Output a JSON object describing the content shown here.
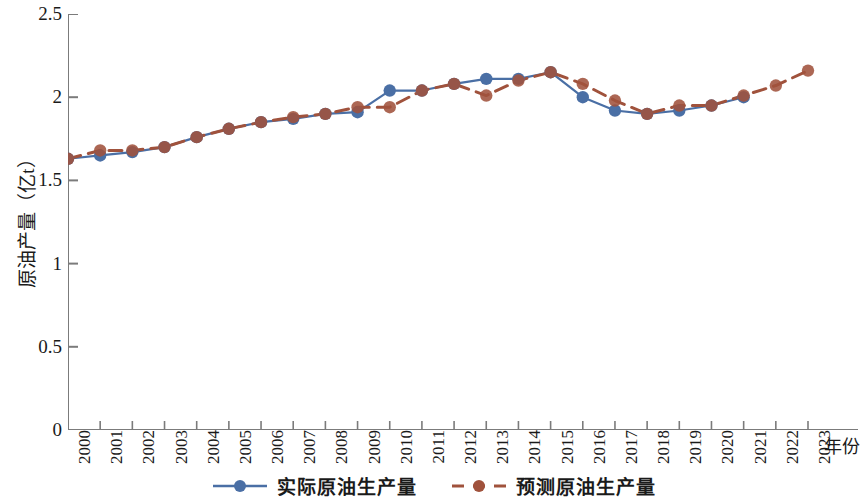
{
  "chart_data": {
    "type": "line",
    "title": "",
    "xlabel": "年份",
    "ylabel": "原油产量（亿t）",
    "categories": [
      "2000",
      "2001",
      "2002",
      "2003",
      "2004",
      "2005",
      "2006",
      "2007",
      "2008",
      "2009",
      "2010",
      "2011",
      "2012",
      "2013",
      "2014",
      "2015",
      "2016",
      "2017",
      "2018",
      "2019",
      "2020",
      "2021",
      "2022",
      "2023"
    ],
    "xlim": [
      2000,
      2023
    ],
    "ylim": [
      0,
      2.5
    ],
    "yticks": [
      "0",
      "0.5",
      "1",
      "1.5",
      "2",
      "2.5"
    ],
    "ytick_values": [
      0,
      0.5,
      1,
      1.5,
      2,
      2.5
    ],
    "grid": false,
    "legend_position": "bottom",
    "series": [
      {
        "name": "实际原油生产量",
        "style": "solid",
        "color": "#4a6fa5",
        "marker": "circle",
        "x": [
          "2000",
          "2001",
          "2002",
          "2003",
          "2004",
          "2005",
          "2006",
          "2007",
          "2008",
          "2009",
          "2010",
          "2011",
          "2012",
          "2013",
          "2014",
          "2015",
          "2016",
          "2017",
          "2018",
          "2019",
          "2020",
          "2021"
        ],
        "values": [
          1.63,
          1.65,
          1.67,
          1.7,
          1.76,
          1.81,
          1.85,
          1.87,
          1.9,
          1.91,
          2.04,
          2.04,
          2.08,
          2.11,
          2.11,
          2.15,
          2.0,
          1.92,
          1.9,
          1.92,
          1.95,
          2.0
        ]
      },
      {
        "name": "预测原油生产量",
        "style": "dashed",
        "color": "#a0523c",
        "marker": "circle",
        "x": [
          "2000",
          "2001",
          "2002",
          "2003",
          "2004",
          "2005",
          "2006",
          "2007",
          "2008",
          "2009",
          "2010",
          "2011",
          "2012",
          "2013",
          "2014",
          "2015",
          "2016",
          "2017",
          "2018",
          "2019",
          "2020",
          "2021",
          "2022",
          "2023"
        ],
        "values": [
          1.63,
          1.68,
          1.68,
          1.7,
          1.76,
          1.81,
          1.85,
          1.88,
          1.9,
          1.94,
          1.94,
          2.04,
          2.08,
          2.01,
          2.1,
          2.15,
          2.08,
          1.98,
          1.9,
          1.95,
          1.95,
          2.01,
          2.07,
          2.16
        ]
      }
    ]
  },
  "legend": {
    "items": [
      {
        "label": "实际原油生产量",
        "color": "#4a6fa5",
        "style": "solid"
      },
      {
        "label": "预测原油生产量",
        "color": "#a0523c",
        "style": "dashed"
      }
    ]
  },
  "axis": {
    "x_title": "年份",
    "y_title": "原油产量（亿t）"
  }
}
